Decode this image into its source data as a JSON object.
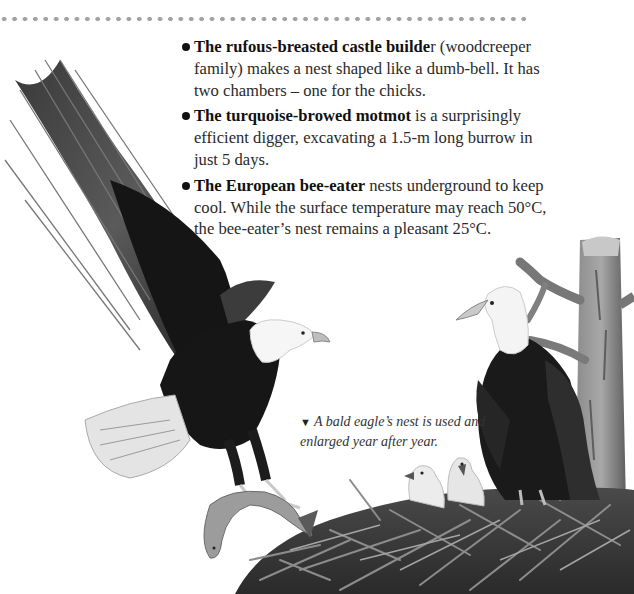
{
  "page": {
    "decoration": "dotted-rule",
    "facts": [
      {
        "bold": "The rufous-breasted castle builde",
        "bold_tail": "r",
        "text": " (woodcreeper family) makes a nest shaped like a dumb-bell. It has two chambers – one for the chicks."
      },
      {
        "bold": "The turquoise-browed motmot",
        "bold_tail": "",
        "text": " is a surprisingly efficient digger, excavating a 1.5-m long burrow in just 5 days."
      },
      {
        "bold": "The European bee-eater",
        "bold_tail": "",
        "text": " nests underground to keep cool. While the surface temperature may reach 50°C, the bee-eater’s nest remains a pleasant 25°C."
      }
    ],
    "caption": {
      "marker": "▼",
      "text": "A bald eagle’s nest is used and enlarged year after year."
    },
    "illustration": {
      "subjects": [
        "flying-bald-eagle",
        "fish",
        "perched-bald-eagle",
        "eaglet",
        "eaglet",
        "nest",
        "tree"
      ]
    }
  },
  "colors": {
    "dots": "#a3a3a3",
    "text": "#2a2a2a",
    "bullet": "#111111"
  }
}
